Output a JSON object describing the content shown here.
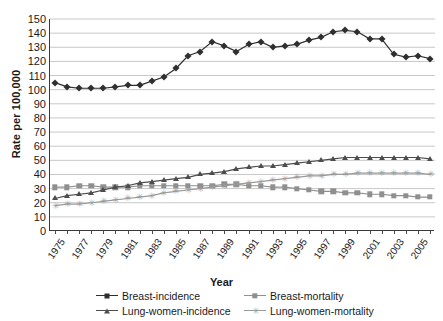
{
  "chart_data": {
    "type": "line",
    "title": "",
    "xlabel": "Year",
    "ylabel": "Rate per 100,000",
    "ylim": [
      0,
      150
    ],
    "ytick_step": 10,
    "yticks": [
      0,
      10,
      20,
      30,
      40,
      50,
      60,
      70,
      80,
      90,
      100,
      110,
      120,
      130,
      140,
      150
    ],
    "grid": true,
    "grid_axis": "y",
    "legend_position": "bottom",
    "x": [
      1975,
      1976,
      1977,
      1978,
      1979,
      1980,
      1981,
      1982,
      1983,
      1984,
      1985,
      1986,
      1987,
      1988,
      1989,
      1990,
      1991,
      1992,
      1993,
      1994,
      1995,
      1996,
      1997,
      1998,
      1999,
      2000,
      2001,
      2002,
      2003,
      2004,
      2005,
      2006
    ],
    "xtick_labels": [
      "1975",
      "1977",
      "1979",
      "1981",
      "1983",
      "1985",
      "1987",
      "1989",
      "1991",
      "1993",
      "1995",
      "1997",
      "1999",
      "2001",
      "2003",
      "2005"
    ],
    "xtick_values": [
      1975,
      1977,
      1979,
      1981,
      1983,
      1985,
      1987,
      1989,
      1991,
      1993,
      1995,
      1997,
      1999,
      2001,
      2003,
      2005
    ],
    "series": [
      {
        "name": "Breast-incidence",
        "marker": "diamond",
        "color": "#2f2f2f",
        "values": [
          105,
          102,
          101,
          101,
          101,
          102,
          103,
          103,
          106,
          109,
          115,
          124,
          127,
          134,
          131,
          127,
          132,
          134,
          130,
          131,
          132,
          135,
          137,
          141,
          142,
          141,
          136,
          136,
          125,
          123,
          124,
          122
        ]
      },
      {
        "name": "Breast-mortality",
        "marker": "square",
        "color": "#8f8f8f",
        "values": [
          31,
          31,
          32,
          32,
          31,
          31,
          31,
          32,
          32,
          32,
          32,
          32,
          32,
          32,
          33,
          33,
          32,
          32,
          31,
          31,
          30,
          29,
          28,
          28,
          27,
          27,
          26,
          26,
          25,
          25,
          24,
          24
        ]
      },
      {
        "name": "Lung-women-incidence",
        "marker": "triangle",
        "color": "#4d4d4d",
        "values": [
          23,
          25,
          26,
          27,
          29,
          31,
          32,
          34,
          35,
          36,
          37,
          38,
          40,
          41,
          42,
          44,
          45,
          46,
          46,
          47,
          48,
          49,
          50,
          51,
          52,
          52,
          52,
          52,
          52,
          52,
          52,
          51
        ]
      },
      {
        "name": "Lung-women-mortality",
        "marker": "x",
        "color": "#9a9a9a",
        "values": [
          18,
          19,
          19,
          20,
          21,
          22,
          23,
          24,
          25,
          27,
          28,
          29,
          30,
          31,
          32,
          33,
          34,
          35,
          36,
          37,
          38,
          39,
          39,
          40,
          40,
          41,
          41,
          41,
          41,
          41,
          41,
          40
        ]
      }
    ]
  }
}
